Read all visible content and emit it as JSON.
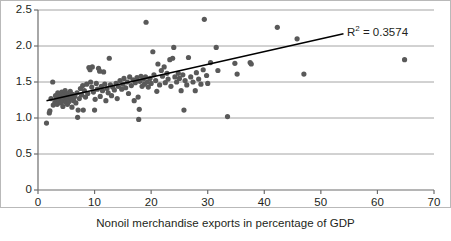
{
  "chart_data": {
    "type": "scatter",
    "title": "",
    "xlabel": "Nonoil merchandise exports in percentage of GDP",
    "ylabel": "",
    "xlim": [
      0,
      70
    ],
    "ylim": [
      0,
      2.5
    ],
    "xticks": [
      "0",
      "10",
      "20",
      "30",
      "40",
      "50",
      "60",
      "70"
    ],
    "yticks": [
      "0",
      "0.5",
      "1.0",
      "1.5",
      "2.0",
      "2.5"
    ],
    "grid": "horizontal",
    "legend": "none",
    "annotations": [
      {
        "name": "r-squared",
        "prefix": "R",
        "exponent": "2",
        "suffix": " = 0.3574",
        "text": "R2 = 0.3574"
      }
    ],
    "series": [
      {
        "name": "countries",
        "marker": "circle",
        "color": "#595959",
        "points": [
          [
            1.5,
            0.93
          ],
          [
            2.0,
            1.07
          ],
          [
            2.1,
            1.1
          ],
          [
            2.3,
            1.27
          ],
          [
            2.6,
            1.5
          ],
          [
            2.7,
            1.18
          ],
          [
            3.0,
            1.22
          ],
          [
            3.1,
            1.31
          ],
          [
            3.3,
            1.26
          ],
          [
            3.4,
            1.19
          ],
          [
            3.5,
            1.35
          ],
          [
            3.6,
            1.29
          ],
          [
            3.8,
            1.24
          ],
          [
            3.9,
            1.33
          ],
          [
            4.0,
            1.28
          ],
          [
            4.1,
            1.21
          ],
          [
            4.2,
            1.36
          ],
          [
            4.3,
            1.3
          ],
          [
            4.4,
            1.16
          ],
          [
            4.5,
            1.25
          ],
          [
            4.6,
            1.32
          ],
          [
            4.7,
            1.27
          ],
          [
            4.8,
            1.38
          ],
          [
            4.9,
            1.22
          ],
          [
            5.0,
            1.29
          ],
          [
            5.1,
            1.34
          ],
          [
            5.2,
            1.19
          ],
          [
            5.3,
            1.26
          ],
          [
            5.4,
            1.31
          ],
          [
            5.5,
            1.23
          ],
          [
            5.7,
            1.37
          ],
          [
            5.8,
            1.28
          ],
          [
            6.0,
            1.15
          ],
          [
            6.1,
            1.33
          ],
          [
            6.3,
            1.24
          ],
          [
            6.5,
            1.3
          ],
          [
            6.7,
            1.21
          ],
          [
            6.9,
            1.35
          ],
          [
            7.0,
            1.01
          ],
          [
            7.1,
            1.11
          ],
          [
            7.3,
            1.27
          ],
          [
            7.5,
            1.41
          ],
          [
            7.7,
            1.32
          ],
          [
            7.9,
            1.45
          ],
          [
            8.0,
            1.11
          ],
          [
            8.2,
            1.38
          ],
          [
            8.4,
            1.29
          ],
          [
            8.6,
            1.47
          ],
          [
            8.8,
            1.34
          ],
          [
            9.0,
            1.7
          ],
          [
            9.2,
            1.67
          ],
          [
            9.3,
            1.5
          ],
          [
            9.5,
            1.43
          ],
          [
            9.6,
            1.71
          ],
          [
            9.8,
            1.36
          ],
          [
            10.0,
            1.11
          ],
          [
            10.1,
            1.26
          ],
          [
            10.3,
            1.48
          ],
          [
            10.5,
            1.4
          ],
          [
            10.7,
            1.69
          ],
          [
            10.9,
            1.65
          ],
          [
            11.0,
            1.3
          ],
          [
            11.2,
            1.44
          ],
          [
            11.4,
            1.38
          ],
          [
            11.6,
            1.64
          ],
          [
            11.8,
            1.47
          ],
          [
            12.0,
            1.24
          ],
          [
            12.2,
            1.41
          ],
          [
            12.4,
            1.35
          ],
          [
            12.6,
            1.83
          ],
          [
            12.8,
            1.46
          ],
          [
            13.0,
            1.31
          ],
          [
            13.2,
            1.43
          ],
          [
            13.5,
            1.39
          ],
          [
            13.8,
            1.48
          ],
          [
            14.0,
            1.27
          ],
          [
            14.2,
            1.44
          ],
          [
            14.5,
            1.52
          ],
          [
            14.8,
            1.4
          ],
          [
            15.0,
            1.47
          ],
          [
            15.2,
            1.55
          ],
          [
            15.5,
            1.42
          ],
          [
            15.8,
            1.5
          ],
          [
            16.0,
            1.34
          ],
          [
            16.2,
            1.57
          ],
          [
            16.5,
            1.45
          ],
          [
            16.8,
            1.53
          ],
          [
            17.0,
            1.24
          ],
          [
            17.2,
            1.49
          ],
          [
            17.5,
            1.56
          ],
          [
            17.7,
            1.29
          ],
          [
            17.8,
            0.98
          ],
          [
            17.9,
            1.12
          ],
          [
            18.0,
            1.51
          ],
          [
            18.2,
            1.58
          ],
          [
            18.4,
            1.44
          ],
          [
            18.6,
            1.54
          ],
          [
            18.8,
            1.47
          ],
          [
            19.0,
            1.57
          ],
          [
            19.1,
            2.33
          ],
          [
            19.3,
            1.5
          ],
          [
            19.5,
            1.43
          ],
          [
            19.8,
            1.55
          ],
          [
            20.0,
            1.48
          ],
          [
            20.3,
            1.92
          ],
          [
            20.5,
            1.6
          ],
          [
            20.8,
            1.52
          ],
          [
            21.0,
            1.37
          ],
          [
            21.2,
            1.75
          ],
          [
            21.5,
            1.46
          ],
          [
            21.8,
            1.66
          ],
          [
            22.0,
            1.58
          ],
          [
            22.3,
            1.71
          ],
          [
            22.5,
            1.49
          ],
          [
            22.8,
            1.62
          ],
          [
            23.0,
            1.54
          ],
          [
            23.3,
            1.81
          ],
          [
            23.5,
            1.44
          ],
          [
            23.8,
            1.83
          ],
          [
            24.0,
            1.98
          ],
          [
            24.2,
            1.57
          ],
          [
            24.5,
            1.5
          ],
          [
            24.8,
            1.62
          ],
          [
            25.0,
            1.55
          ],
          [
            25.3,
            1.38
          ],
          [
            25.6,
            1.6
          ],
          [
            25.8,
            1.11
          ],
          [
            26.0,
            1.52
          ],
          [
            26.3,
            1.46
          ],
          [
            26.6,
            1.84
          ],
          [
            27.0,
            1.57
          ],
          [
            27.4,
            1.5
          ],
          [
            27.8,
            1.38
          ],
          [
            28.0,
            1.63
          ],
          [
            28.4,
            1.54
          ],
          [
            28.8,
            1.47
          ],
          [
            29.2,
            1.67
          ],
          [
            29.4,
            2.37
          ],
          [
            29.8,
            1.59
          ],
          [
            30.0,
            1.48
          ],
          [
            30.5,
            1.77
          ],
          [
            31.5,
            1.98
          ],
          [
            31.8,
            1.66
          ],
          [
            33.5,
            1.02
          ],
          [
            34.8,
            1.76
          ],
          [
            35.2,
            1.61
          ],
          [
            37.5,
            1.77
          ],
          [
            37.7,
            1.75
          ],
          [
            42.3,
            2.26
          ],
          [
            45.8,
            2.1
          ],
          [
            47.0,
            1.61
          ],
          [
            64.8,
            1.81
          ]
        ]
      }
    ],
    "trendline": {
      "name": "linear-fit",
      "color": "#000000",
      "x0": 1.5,
      "y0": 1.24,
      "x1": 54.0,
      "y1": 2.17
    }
  }
}
